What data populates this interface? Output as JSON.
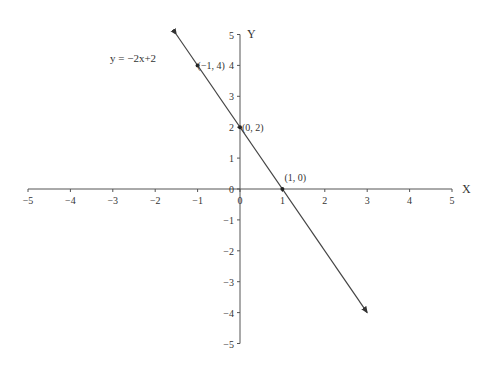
{
  "chart_data": {
    "type": "line",
    "title": "",
    "equation_label": "y = −2x+2",
    "xlabel": "X",
    "ylabel": "Y",
    "xlim": [
      -5,
      5
    ],
    "ylim": [
      -5,
      5
    ],
    "grid": false,
    "x_ticks": [
      "−5",
      "−4",
      "−3",
      "−2",
      "−1",
      "0",
      "1",
      "2",
      "3",
      "4",
      "5"
    ],
    "y_ticks": [
      "−5",
      "−4",
      "−3",
      "−2",
      "−1",
      "0",
      "1",
      "2",
      "3",
      "4",
      "5"
    ],
    "series": [
      {
        "name": "y = −2x+2",
        "slope": -2,
        "intercept": 2,
        "x": [
          -1.5,
          3
        ],
        "y": [
          5,
          -4
        ],
        "arrows": "both"
      }
    ],
    "points": [
      {
        "x": -1,
        "y": 4,
        "label": "(−1, 4)"
      },
      {
        "x": 0,
        "y": 2,
        "label": "(0, 2)"
      },
      {
        "x": 1,
        "y": 0,
        "label": "(1, 0)"
      }
    ],
    "colors": {
      "axis": "#555555",
      "line": "#444444",
      "text": "#333333"
    }
  }
}
